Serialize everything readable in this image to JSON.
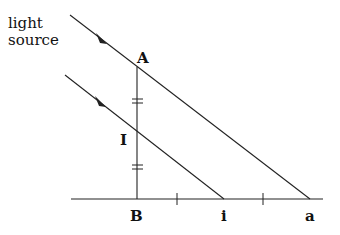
{
  "diagram": {
    "source_label_line1": "light",
    "source_label_line2": "source",
    "points": {
      "A": "A",
      "I": "I",
      "B": "B",
      "i": "i",
      "a": "a"
    },
    "stroke_color": "#222222",
    "background": "#ffffff"
  }
}
